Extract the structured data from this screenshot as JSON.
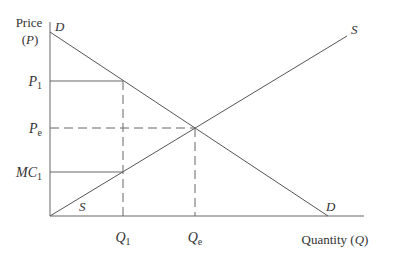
{
  "diagram": {
    "type": "supply-demand",
    "y_axis": {
      "label_line1": "Price",
      "label_line2": "(P)"
    },
    "x_axis": {
      "label": "Quantity (Q)",
      "label_text": "Quantity (",
      "label_var": "Q",
      "label_close": ")"
    },
    "curves": {
      "demand": {
        "name": "D",
        "label_top": "D",
        "label_bottom": "D"
      },
      "supply": {
        "name": "S",
        "label_top": "S",
        "label_bottom": "S"
      }
    },
    "y_ticks": [
      {
        "main": "P",
        "sub": "1"
      },
      {
        "main": "P",
        "sub": "e"
      },
      {
        "main": "MC",
        "sub": "1"
      }
    ],
    "x_ticks": [
      {
        "main": "Q",
        "sub": "1"
      },
      {
        "main": "Q",
        "sub": "e"
      }
    ],
    "colors": {
      "line": "#555555",
      "text": "#333333",
      "background": "#ffffff"
    }
  }
}
